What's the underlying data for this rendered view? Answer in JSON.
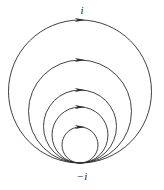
{
  "figure": {
    "caption_top": "i",
    "caption_bottom": "−i",
    "background_color": "#ffffff",
    "stroke_color": "#2b2b2b",
    "stroke_width": 0.9,
    "width": 164,
    "height": 190,
    "tangent_point": {
      "x": 80,
      "y": 163,
      "label": "−i"
    },
    "top_point": {
      "x": 80,
      "y": 20,
      "label": "i"
    },
    "circles": [
      {
        "name": "circle-outer",
        "cx": 80,
        "cy": 91.5,
        "r": 71.5,
        "arrow_y": 20,
        "arrow_name": "arrowhead-circle-outer"
      },
      {
        "name": "circle-2",
        "cx": 80,
        "cy": 111.5,
        "r": 51.5,
        "arrow_y": 60,
        "arrow_name": "arrowhead-circle-2"
      },
      {
        "name": "circle-3",
        "cx": 80,
        "cy": 126.5,
        "r": 36.5,
        "arrow_y": 90,
        "arrow_name": "arrowhead-circle-3"
      },
      {
        "name": "circle-4",
        "cx": 80,
        "cy": 135.0,
        "r": 28.0,
        "arrow_y": 107,
        "arrow_name": "arrowhead-circle-4"
      },
      {
        "name": "circle-5",
        "cx": 80,
        "cy": 145.0,
        "r": 18.0,
        "arrow_y": 127,
        "arrow_name": "arrowhead-circle-5"
      }
    ],
    "arrow": {
      "direction": "clockwise",
      "half_length": 5.2,
      "half_width": 2.1
    }
  },
  "chart_data": {
    "type": "line",
    "title": "",
    "xlabel": "",
    "ylabel": "",
    "grid": false,
    "legend_position": "none",
    "annotations": [
      "i",
      "−i"
    ],
    "series": [
      {
        "name": "circle-outer",
        "radius": 71.5,
        "center_y": 91.5,
        "orientation": "clockwise"
      },
      {
        "name": "circle-2",
        "radius": 51.5,
        "center_y": 111.5,
        "orientation": "clockwise"
      },
      {
        "name": "circle-3",
        "radius": 36.5,
        "center_y": 126.5,
        "orientation": "clockwise"
      },
      {
        "name": "circle-4",
        "radius": 28.0,
        "center_y": 135.0,
        "orientation": "clockwise"
      },
      {
        "name": "circle-5",
        "radius": 18.0,
        "center_y": 145.0,
        "orientation": "clockwise"
      }
    ]
  }
}
